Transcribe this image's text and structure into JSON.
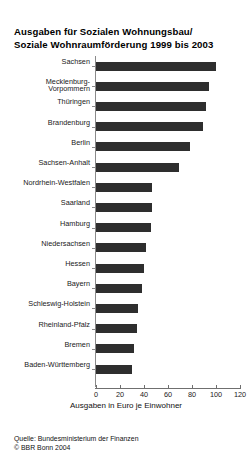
{
  "title": {
    "line1": "Ausgaben für Sozialen Wohnungsbau/",
    "line2": "Soziale Wohnraumförderung 1999 bis 2003"
  },
  "footer": {
    "source": "Quelle: Bundesministerium der Finanzen",
    "copyright": "© BBR Bonn 2004"
  },
  "chart_data": {
    "type": "bar",
    "orientation": "horizontal",
    "title": "Ausgaben für Sozialen Wohnungsbau/ Soziale Wohnraumförderung 1999 bis 2003",
    "xlabel": "Ausgaben in Euro je Einwohner",
    "ylabel": "",
    "xlim": [
      0,
      120
    ],
    "xticks": [
      0,
      20,
      40,
      60,
      80,
      100,
      120
    ],
    "grid": false,
    "legend": false,
    "bar_color": "#2e2e2e",
    "categories": [
      "Sachsen",
      "Mecklenburg-\nVorpommern",
      "Thüringen",
      "Brandenburg",
      "Berlin",
      "Sachsen-Anhalt",
      "Nordrhein-Westfalen",
      "Saarland",
      "Hamburg",
      "Niedersachsen",
      "Hessen",
      "Bayern",
      "Schleswig-Holstein",
      "Rheinland-Pfalz",
      "Bremen",
      "Baden-Württemberg"
    ],
    "values": [
      100,
      94,
      92,
      89,
      78,
      69,
      47,
      47,
      46,
      42,
      40,
      38,
      35,
      34,
      32,
      30
    ]
  }
}
